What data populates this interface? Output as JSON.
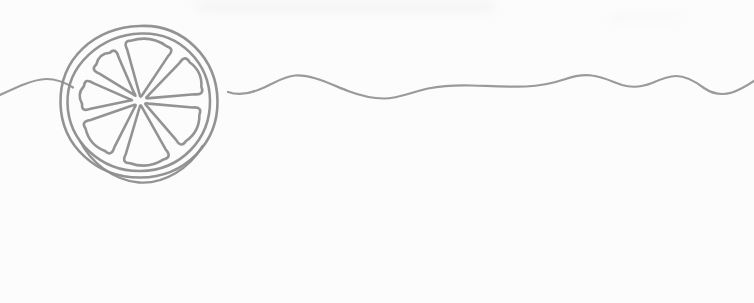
{
  "illustration": {
    "description": "Minimalist continuous-line drawing of a citrus fruit slice with seven inner segments, flanked by a long hand-drawn wavy line on a white background",
    "background_color": "#fcfcfc",
    "line_color": "#8d8d8d",
    "wave_line_color": "#959595",
    "canvas": {
      "width": 754,
      "height": 303
    },
    "citrus": {
      "center": {
        "x": 140,
        "y": 101
      },
      "outer_rim_path": "M 140,26 C 184,24 217,59 217.5,101 C 218,143 185,177 140.5,177.5 C 97,178 61.5,146 60.5,103.5 C 59.5,59 94,27.5 140,26 Z",
      "inner_rim_path": "M 141,33.5 C 180,32 209.5,63 210,100.5 C 210.5,139 181,170.5 140.5,171 C 101,171.5 68.5,141.5 67.5,103.5 C 66.5,65 101,35 141,33.5 Z",
      "bottom_overlap_path": "M 80,141 C 90,161 112,180 139,182.5 C 164,184.5 190,168 202.5,146",
      "wedges": [
        {
          "name": "top",
          "start_angle": -17,
          "end_angle": 35,
          "outer_radius": 62,
          "apex_radius": 7
        },
        {
          "name": "upper-right",
          "start_angle": 43,
          "end_angle": 86,
          "outer_radius": 64,
          "apex_radius": 10
        },
        {
          "name": "lower-right",
          "start_angle": 94,
          "end_angle": 140,
          "outer_radius": 62,
          "apex_radius": 9
        },
        {
          "name": "bottom",
          "start_angle": 149,
          "end_angle": 198,
          "outer_radius": 64,
          "apex_radius": 7
        },
        {
          "name": "lower-left",
          "start_angle": 206,
          "end_angle": 252,
          "outer_radius": 62,
          "apex_radius": 9
        },
        {
          "name": "left",
          "start_angle": 258,
          "end_angle": 294,
          "outer_radius": 59,
          "apex_radius": 11
        },
        {
          "name": "upper-left",
          "start_angle": 301,
          "end_angle": 337,
          "outer_radius": 58,
          "apex_radius": 10
        }
      ]
    },
    "left_wave_path": "M 0,95 C 14,88.5 32,79.5 46,79 C 56,78.8 65,82.5 73,87.5",
    "right_wave_path": "M 228,92 C 238,95.5 248,94 258,90 C 275,83 283,76.5 295,75.5 C 312,74.5 330,84 348,91 C 360,95.5 372,98.5 384,98.5 C 398,98.5 412,92 428,88.5 C 444,85.5 458,85 472,85.5 C 490,86 508,87 526,86.5 C 540,86 552,83.5 564,79.5 C 574,76 584,74.5 592,75.5 C 602,76.5 612,81.5 622,85 C 632,88 642,87 652,83 C 660,79.5 668,76 676,76 C 686,76 696,82 704,88 C 712,93.5 722,95.5 732,92.5 C 740,90 748,85 754,81"
  }
}
